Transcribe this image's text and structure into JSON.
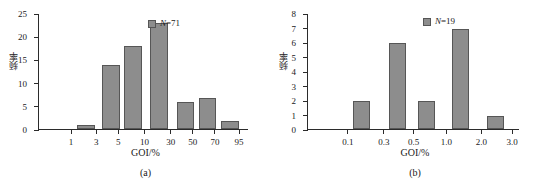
{
  "figure": {
    "panels": [
      {
        "caption": "(a)",
        "xlabel": "GOI/%",
        "ylabel": "频率",
        "legend": {
          "symbol": "N",
          "equals": "=",
          "value": "71",
          "text": "N=71"
        }
      },
      {
        "caption": "(b)",
        "xlabel": "GOI/%",
        "ylabel": "频率",
        "legend": {
          "symbol": "N",
          "equals": "=",
          "value": "19",
          "text": "N=19"
        }
      }
    ]
  },
  "chart_data": [
    {
      "type": "bar",
      "title": "",
      "subtitle": "(a)",
      "xlabel": "GOI/%",
      "ylabel": "频率",
      "legend": [
        "N=71"
      ],
      "legend_position": "top-right",
      "grid": false,
      "xscale": "probability",
      "xtick_labels": [
        "1",
        "3",
        "5",
        "10",
        "30",
        "50",
        "70",
        "95"
      ],
      "xtick_positions_pct": [
        15.5,
        27.5,
        38.0,
        50.5,
        63.0,
        73.5,
        84.0,
        95.5
      ],
      "ytick_labels": [
        "0",
        "5",
        "10",
        "15",
        "20",
        "25"
      ],
      "ylim": [
        0,
        25
      ],
      "yticks": [
        0,
        5,
        10,
        15,
        20,
        25
      ],
      "categories": [
        "1-3",
        "3-5",
        "5-10",
        "10-30",
        "30-50",
        "50-70",
        "70-95"
      ],
      "values": [
        1,
        14,
        18,
        23,
        6,
        7,
        2
      ],
      "bars": [
        {
          "label": "1-3",
          "value": 1,
          "left_pct": 18.5,
          "width_pct": 8.5
        },
        {
          "label": "3-5",
          "value": 14,
          "left_pct": 30.5,
          "width_pct": 8.5
        },
        {
          "label": "5-10",
          "value": 18,
          "left_pct": 41.0,
          "width_pct": 8.5
        },
        {
          "label": "10-30",
          "value": 23,
          "left_pct": 53.5,
          "width_pct": 8.5
        },
        {
          "label": "30-50",
          "value": 6,
          "left_pct": 66.0,
          "width_pct": 8.5
        },
        {
          "label": "50-70",
          "value": 7,
          "left_pct": 76.5,
          "width_pct": 8.5
        },
        {
          "label": "70-95",
          "value": 2,
          "left_pct": 87.0,
          "width_pct": 8.5
        }
      ],
      "sample_size": 71,
      "bar_color": "#8d8d8d",
      "bar_edge_color": "#565656"
    },
    {
      "type": "bar",
      "title": "",
      "subtitle": "(b)",
      "xlabel": "GOI/%",
      "ylabel": "频率",
      "legend": [
        "N=19"
      ],
      "legend_position": "top-right",
      "grid": false,
      "xscale": "log",
      "xtick_labels": [
        "0.1",
        "0.3",
        "0.5",
        "1.0",
        "2.0",
        "3.0"
      ],
      "xtick_positions_pct": [
        19.0,
        36.0,
        50.0,
        65.5,
        82.0,
        96.5
      ],
      "ytick_labels": [
        "0",
        "1",
        "2",
        "3",
        "4",
        "5",
        "6",
        "7",
        "8"
      ],
      "ylim": [
        0,
        8
      ],
      "yticks": [
        0,
        1,
        2,
        3,
        4,
        5,
        6,
        7,
        8
      ],
      "categories": [
        "0.1-0.3",
        "0.3-0.5",
        "0.5-1.0",
        "1.0-2.0",
        "2.0-3.0"
      ],
      "values": [
        2,
        6,
        2,
        7,
        1
      ],
      "bars": [
        {
          "label": "0.1-0.3",
          "value": 2,
          "left_pct": 21.5,
          "width_pct": 8.0
        },
        {
          "label": "0.3-0.5",
          "value": 6,
          "left_pct": 38.5,
          "width_pct": 8.0
        },
        {
          "label": "0.5-1.0",
          "value": 2,
          "left_pct": 52.5,
          "width_pct": 8.0
        },
        {
          "label": "1.0-2.0",
          "value": 7,
          "left_pct": 68.5,
          "width_pct": 8.0
        },
        {
          "label": "2.0-3.0",
          "value": 1,
          "left_pct": 85.0,
          "width_pct": 8.0
        }
      ],
      "sample_size": 19,
      "bar_color": "#8d8d8d",
      "bar_edge_color": "#565656"
    }
  ]
}
